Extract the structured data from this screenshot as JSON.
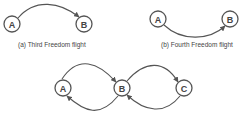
{
  "diagrams": [
    {
      "id": "a",
      "caption": "(a) Third Freedom flight",
      "nodes": [
        {
          "label": "A"
        },
        {
          "label": "B"
        }
      ],
      "edges": [
        {
          "from": "A",
          "to": "B",
          "arrow_at": "B"
        }
      ]
    },
    {
      "id": "b",
      "caption": "(b) Fourth Freedom flight",
      "nodes": [
        {
          "label": "A"
        },
        {
          "label": "B"
        }
      ],
      "edges": [
        {
          "from": "A",
          "to": "B",
          "arrow_at": "B"
        }
      ]
    },
    {
      "id": "c",
      "caption": "",
      "nodes": [
        {
          "label": "A"
        },
        {
          "label": "B"
        },
        {
          "label": "C"
        }
      ],
      "edges": [
        {
          "from": "A",
          "to": "B",
          "arrow_at": "B",
          "route": "over"
        },
        {
          "from": "B",
          "to": "A",
          "arrow_at": "A",
          "route": "under"
        },
        {
          "from": "C",
          "to": "B",
          "arrow_at": "B",
          "route": "under"
        },
        {
          "from": "B",
          "to": "C",
          "arrow_at": "C",
          "route": "over"
        }
      ]
    }
  ],
  "colors": {
    "stroke": "#555555",
    "text": "#444444",
    "background": "#ffffff"
  }
}
